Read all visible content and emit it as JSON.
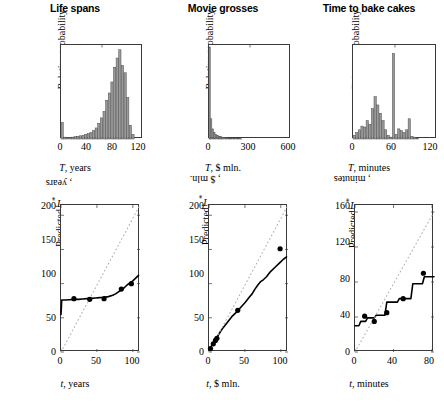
{
  "figure": {
    "background": "#ffffff",
    "bar_fill": "#9a9a9a",
    "bar_stroke": "#4d4d4d",
    "line_color": "#000000",
    "dotted_color": "#b0b0b0",
    "marker_color": "#000000",
    "axis_color": "#3a3a3a"
  },
  "chart_data": [
    {
      "id": "hist-life-spans",
      "type": "bar",
      "title": "Life spans",
      "xlabel": "T, years",
      "ylabel": "Relative probability",
      "xlim": [
        0,
        125
      ],
      "ylim": [
        0,
        1.0
      ],
      "xticks": [
        0,
        40,
        80,
        120
      ],
      "xtick_labels": [
        "0",
        "40",
        "80",
        "120"
      ],
      "yticks": [],
      "ytick_labels": [],
      "grid": false,
      "bin_width": 4,
      "categories": [
        0,
        4,
        8,
        12,
        16,
        20,
        24,
        28,
        32,
        36,
        40,
        44,
        48,
        52,
        56,
        60,
        64,
        68,
        72,
        76,
        80,
        84,
        88,
        92,
        96,
        100,
        104,
        108
      ],
      "values": [
        0.18,
        0.02,
        0.015,
        0.015,
        0.02,
        0.025,
        0.03,
        0.035,
        0.04,
        0.05,
        0.06,
        0.07,
        0.09,
        0.12,
        0.17,
        0.23,
        0.3,
        0.42,
        0.5,
        0.62,
        0.78,
        0.88,
        0.97,
        0.8,
        0.72,
        0.45,
        0.15,
        0.05
      ]
    },
    {
      "id": "hist-movie-grosses",
      "type": "bar",
      "title": "Movie grosses",
      "xlabel": "T, $ mln.",
      "ylabel": "Relative probability",
      "xlim": [
        0,
        620
      ],
      "ylim": [
        0,
        1.0
      ],
      "xticks": [
        0,
        300,
        600
      ],
      "xtick_labels": [
        "0",
        "300",
        "600"
      ],
      "yticks": [],
      "ytick_labels": [],
      "grid": false,
      "bin_width": 12,
      "categories": [
        0,
        12,
        24,
        36,
        48,
        60,
        72,
        84,
        96,
        108,
        120,
        132,
        144,
        156,
        168,
        180,
        192,
        204,
        216,
        228,
        240
      ],
      "values": [
        1.0,
        0.22,
        0.11,
        0.07,
        0.05,
        0.04,
        0.03,
        0.025,
        0.02,
        0.018,
        0.015,
        0.012,
        0.01,
        0.009,
        0.008,
        0.007,
        0.006,
        0.005,
        0.004,
        0.003,
        0.002
      ]
    },
    {
      "id": "hist-bake-cakes",
      "type": "bar",
      "title": "Time to bake cakes",
      "xlabel": "T, minutes",
      "ylabel": "Relative probability",
      "xlim": [
        0,
        128
      ],
      "ylim": [
        0,
        1.0
      ],
      "xticks": [
        0,
        60,
        120
      ],
      "xtick_labels": [
        "0",
        "60",
        "120"
      ],
      "yticks": [],
      "ytick_labels": [],
      "grid": false,
      "bin_width": 4,
      "categories": [
        0,
        4,
        8,
        12,
        16,
        20,
        24,
        28,
        32,
        36,
        40,
        44,
        48,
        52,
        56,
        60,
        64,
        68,
        72,
        76,
        80,
        84,
        88,
        92,
        96,
        100,
        104
      ],
      "values": [
        0.04,
        0.07,
        0.1,
        0.14,
        0.13,
        0.2,
        0.16,
        0.33,
        0.46,
        0.37,
        0.28,
        0.2,
        0.1,
        0.04,
        0.02,
        0.93,
        0.05,
        0.11,
        0.09,
        0.07,
        0.1,
        0.22,
        0.03,
        0.02,
        0.01,
        0.0,
        0.0
      ]
    },
    {
      "id": "pred-life-spans",
      "type": "line",
      "title": "",
      "xlabel": "t, years",
      "ylabel": "Predicted T*, years",
      "xlim": [
        0,
        110
      ],
      "ylim": [
        0,
        215
      ],
      "xticks": [
        0,
        50,
        100
      ],
      "xtick_labels": [
        "0",
        "50",
        "100"
      ],
      "yticks": [
        0,
        50,
        100,
        150,
        200
      ],
      "ytick_labels": [
        "0",
        "50",
        "100",
        "150",
        "200"
      ],
      "grid": false,
      "series": [
        {
          "name": "predicted",
          "style": "solid",
          "x": [
            0,
            1,
            2,
            6,
            12,
            18,
            24,
            30,
            36,
            42,
            48,
            54,
            60,
            66,
            72,
            76,
            80,
            84,
            88,
            92,
            96,
            100,
            104,
            108
          ],
          "y": [
            55,
            76,
            76,
            76,
            76.5,
            77,
            77,
            77.5,
            78,
            78.5,
            79,
            79.5,
            80,
            81,
            83,
            85,
            88,
            91,
            94,
            98,
            101,
            104,
            108,
            112
          ]
        },
        {
          "name": "identity",
          "style": "dotted",
          "x": [
            0,
            110
          ],
          "y": [
            0,
            215
          ]
        }
      ],
      "markers": {
        "name": "observations",
        "x": [
          18,
          40,
          60,
          84,
          98
        ],
        "y": [
          78,
          77,
          78,
          92,
          100
        ]
      }
    },
    {
      "id": "pred-movie-grosses",
      "type": "line",
      "title": "",
      "xlabel": "t, $ mln.",
      "ylabel": "Predicted T*, $ mln.",
      "xlim": [
        0,
        110
      ],
      "ylim": [
        0,
        215
      ],
      "xticks": [
        0,
        50,
        100
      ],
      "xtick_labels": [
        "0",
        "50",
        "100"
      ],
      "yticks": [
        0,
        50,
        100,
        150,
        200
      ],
      "ytick_labels": [
        "0",
        "50",
        "100",
        "150",
        "200"
      ],
      "grid": false,
      "series": [
        {
          "name": "predicted",
          "style": "solid",
          "x": [
            1,
            4,
            8,
            12,
            16,
            20,
            26,
            32,
            38,
            44,
            50,
            56,
            60,
            64,
            68,
            72,
            76,
            80,
            86,
            92,
            98,
            104,
            108
          ],
          "y": [
            4,
            10,
            17,
            23,
            30,
            36,
            44,
            52,
            58,
            65,
            72,
            80,
            85,
            92,
            98,
            103,
            106,
            110,
            118,
            124,
            130,
            136,
            139
          ]
        },
        {
          "name": "identity",
          "style": "dotted",
          "x": [
            0,
            110
          ],
          "y": [
            0,
            215
          ]
        }
      ],
      "markers": {
        "name": "observations",
        "x": [
          2,
          6,
          9,
          11,
          40,
          99
        ],
        "y": [
          5,
          12,
          17,
          20,
          61,
          151
        ]
      }
    },
    {
      "id": "pred-bake-cakes",
      "type": "line",
      "title": "",
      "xlabel": "t, minutes",
      "ylabel": "Predicted T*, minutes",
      "xlim": [
        0,
        82
      ],
      "ylim": [
        0,
        168
      ],
      "xticks": [
        0,
        40,
        80
      ],
      "xtick_labels": [
        "0",
        "40",
        "80"
      ],
      "yticks": [
        0,
        40,
        80,
        120,
        160
      ],
      "ytick_labels": [
        "0",
        "40",
        "80",
        "120",
        "160"
      ],
      "grid": false,
      "series": [
        {
          "name": "predicted",
          "style": "step",
          "x": [
            0,
            4,
            6,
            11,
            13,
            20,
            22,
            31,
            33,
            44,
            46,
            58,
            60,
            70,
            72,
            82
          ],
          "y": [
            30,
            30,
            35,
            35,
            39,
            39,
            42,
            42,
            57,
            57,
            61,
            61,
            78,
            78,
            86,
            86
          ]
        },
        {
          "name": "identity",
          "style": "dotted",
          "x": [
            0,
            82
          ],
          "y": [
            0,
            160
          ]
        }
      ],
      "markers": {
        "name": "observations",
        "x": [
          10,
          20,
          33,
          50,
          71
        ],
        "y": [
          41,
          35,
          45,
          61,
          90
        ]
      }
    }
  ]
}
